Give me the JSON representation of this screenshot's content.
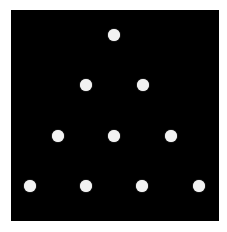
{
  "diagram": {
    "background_color": "#000000",
    "dot_color": "#f2f2f2",
    "shape": "triangular-dot-pattern",
    "rows": [
      {
        "count": 1,
        "dots": [
          {
            "x": 114,
            "y": 35
          }
        ]
      },
      {
        "count": 2,
        "dots": [
          {
            "x": 86,
            "y": 85
          },
          {
            "x": 143,
            "y": 85
          }
        ]
      },
      {
        "count": 3,
        "dots": [
          {
            "x": 58,
            "y": 136
          },
          {
            "x": 114,
            "y": 136
          },
          {
            "x": 171,
            "y": 136
          }
        ]
      },
      {
        "count": 4,
        "dots": [
          {
            "x": 30,
            "y": 186
          },
          {
            "x": 86,
            "y": 186
          },
          {
            "x": 142,
            "y": 186
          },
          {
            "x": 199,
            "y": 186
          }
        ]
      }
    ],
    "total_dots": 10
  }
}
